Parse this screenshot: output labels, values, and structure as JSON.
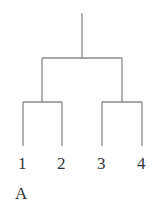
{
  "diagram": {
    "type": "dendrogram",
    "leaves": [
      {
        "label": "1",
        "x": 23
      },
      {
        "label": "2",
        "x": 62
      },
      {
        "label": "3",
        "x": 102
      },
      {
        "label": "4",
        "x": 142
      }
    ],
    "caption": "A",
    "line_color": "#8a8a8a",
    "clusters": [
      {
        "members": [
          "1",
          "2"
        ]
      },
      {
        "members": [
          "3",
          "4"
        ]
      },
      {
        "members": [
          "1",
          "2",
          "3",
          "4"
        ]
      }
    ]
  }
}
